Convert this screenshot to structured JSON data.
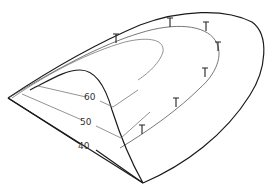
{
  "diagram": {
    "type": "3d-surface-line-drawing",
    "contour_labels": [
      "60",
      "50",
      "40"
    ],
    "marker_glyph": "T",
    "marker_count": 7,
    "colors": {
      "background": "#ffffff",
      "edge": "#1a1a1a",
      "contour": "#777777",
      "label": "#333333"
    }
  }
}
